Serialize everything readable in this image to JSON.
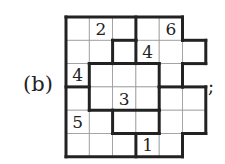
{
  "figure": {
    "label": "(b)",
    "trailing": ";",
    "grid": {
      "cell_size": 23.3,
      "origin": [
        66,
        17
      ],
      "rows": [
        {
          "cols": [
            0,
            1,
            2,
            3,
            4
          ],
          "values": [
            "",
            "2",
            "",
            "",
            "6"
          ]
        },
        {
          "cols": [
            0,
            1,
            2,
            3,
            4,
            5
          ],
          "values": [
            "",
            "",
            "",
            "4",
            "",
            ""
          ]
        },
        {
          "cols": [
            0,
            1,
            2,
            3,
            4
          ],
          "values": [
            "4",
            "",
            "",
            "",
            ""
          ]
        },
        {
          "cols": [
            0,
            1,
            2,
            3,
            4,
            5
          ],
          "values": [
            "",
            "",
            "3",
            "",
            "",
            ""
          ]
        },
        {
          "cols": [
            0,
            1,
            2,
            3,
            4,
            5
          ],
          "values": [
            "5",
            "",
            "",
            "",
            "",
            ""
          ]
        },
        {
          "cols": [
            0,
            1,
            2,
            3,
            4
          ],
          "values": [
            "",
            "",
            "",
            "1",
            ""
          ]
        }
      ]
    },
    "colors": {
      "line": "#222222",
      "thin": "#999999"
    }
  }
}
